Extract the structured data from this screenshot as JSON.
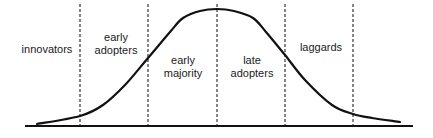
{
  "diagram": {
    "type": "diffusion-of-innovations-bell-curve",
    "colors": {
      "line": "#111111",
      "dashed": "#222222",
      "text": "#1a1a1a",
      "background": "#ffffff"
    },
    "segments": [
      {
        "id": "innovators",
        "lines": [
          "innovators"
        ],
        "x": 47,
        "y": 43
      },
      {
        "id": "early-adopters",
        "lines": [
          "early",
          "adopters"
        ],
        "x": 116,
        "y": 31
      },
      {
        "id": "early-majority",
        "lines": [
          "early",
          "majority"
        ],
        "x": 183,
        "y": 54
      },
      {
        "id": "late-adopters",
        "lines": [
          "late",
          "adopters"
        ],
        "x": 252,
        "y": 54
      },
      {
        "id": "laggards",
        "lines": [
          "laggards"
        ],
        "x": 321,
        "y": 41
      }
    ],
    "dividers_x": [
      80,
      148,
      217,
      285,
      353
    ],
    "baseline": {
      "x1": 25,
      "x2": 413,
      "y": 126
    },
    "curve_points": [
      [
        37,
        124
      ],
      [
        80,
        116
      ],
      [
        103,
        105
      ],
      [
        125,
        85
      ],
      [
        148,
        58
      ],
      [
        170,
        32
      ],
      [
        183,
        18
      ],
      [
        200,
        11
      ],
      [
        217,
        9
      ],
      [
        234,
        11
      ],
      [
        253,
        18
      ],
      [
        266,
        32
      ],
      [
        285,
        55
      ],
      [
        305,
        80
      ],
      [
        332,
        105
      ],
      [
        353,
        114
      ],
      [
        372,
        118
      ],
      [
        400,
        122
      ]
    ]
  }
}
